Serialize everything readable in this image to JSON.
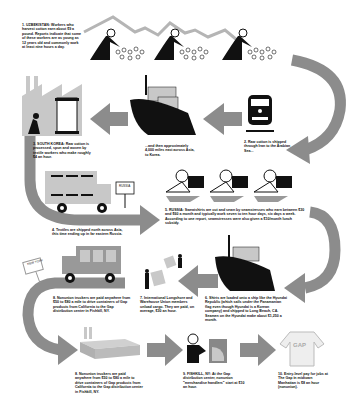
{
  "steps": [
    {
      "id": "1",
      "text": "1. UZBEKISTAN: Workers who harvest cotton earn about $9 a pound. Reports indicate that some of these workers are as young as 12 years old and commonly work at least nine hours a day."
    },
    {
      "id": "2",
      "text": "2. Raw cotton is shipped through Iran to the Arabian Sea..."
    },
    {
      "id": "2b",
      "text": "...and then approximately 4,000 miles east across Asia, to Korea."
    },
    {
      "id": "3",
      "text": "3. SOUTH KOREA: Raw cotton is processed, spun and woven by textile workers who make roughly $4 an hour."
    },
    {
      "id": "4",
      "text": "4. Textiles are shipped north across Asia, this time ending up in far eastern Russia."
    },
    {
      "id": "5",
      "text": "5. RUSSIA: Sweatshirts are cut and sewn by seamstresses who earn between $30 and $60 a month and typically work seven to ten hour days, six days a week. According to one report, seamstresses were also given a $10/month lunch subsidy."
    },
    {
      "id": "6",
      "text": "6. Shirts are loaded onto a ship like the Hyundai Republic (which sails under the Panamanian flag even though Hyundai is a Korean company) and shipped to Long Beach, CA. Seamen on the Hyundai make about $1,250 a month."
    },
    {
      "id": "7",
      "text": "7. International Longshore and Warehouse Union members unload cargo. They are paid, on average, $30 an hour."
    },
    {
      "id": "8",
      "text": "8. Nonunion truckers are paid anywhere from $50 to $80 a mile to drive containers of Gap products from California to the Gap distribution center in Fishkill, NY."
    },
    {
      "id": "9",
      "text": "9. FISHKILL, NY: At the Gap distribution center, nonunion \"merchandise handlers\" start at $10 an hour."
    },
    {
      "id": "10",
      "text": "10. Entry-level pay for jobs at The Gap in midtown Manhattan is $8 an hour (nonunion)."
    },
    {
      "id": "11",
      "text": "11. Sweatshirts can be purchased for $45, sweat not included."
    }
  ],
  "signs": {
    "russia": "RUSSIA",
    "new_york": "NEW YORK"
  },
  "product_label": "GAP",
  "colors": {
    "arrow": "#8c8c8c",
    "figure": "#111111",
    "light": "#c8c8c8",
    "mid": "#a8a8a8"
  }
}
